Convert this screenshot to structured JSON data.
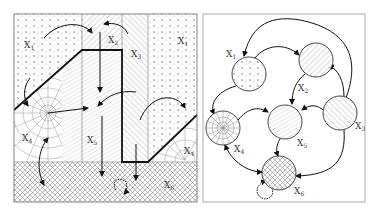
{
  "figure": {
    "left_panel": {
      "title": "state-space partition",
      "regions": [
        {
          "id": "X1",
          "label": "X",
          "sub": "1",
          "pattern": "dots"
        },
        {
          "id": "X1b",
          "label": "X",
          "sub": "1",
          "pattern": "dots"
        },
        {
          "id": "X2",
          "label": "X",
          "sub": "2",
          "pattern": "diagonal-right"
        },
        {
          "id": "X3",
          "label": "X",
          "sub": "3",
          "pattern": "diagonal-left"
        },
        {
          "id": "X4",
          "label": "X",
          "sub": "4",
          "pattern": "radial-web"
        },
        {
          "id": "X4b",
          "label": "X",
          "sub": "4",
          "pattern": "radial-web"
        },
        {
          "id": "X5",
          "label": "X",
          "sub": "5",
          "pattern": "diagonal-fine"
        },
        {
          "id": "X6",
          "label": "X",
          "sub": "6",
          "pattern": "crosshatch"
        }
      ]
    },
    "right_panel": {
      "title": "transition graph",
      "nodes": [
        {
          "id": "X1",
          "label": "X",
          "sub": "1",
          "pattern": "dots"
        },
        {
          "id": "X2",
          "label": "X",
          "sub": "2",
          "pattern": "diagonal-right"
        },
        {
          "id": "X3",
          "label": "X",
          "sub": "3",
          "pattern": "diagonal-left"
        },
        {
          "id": "X4",
          "label": "X",
          "sub": "4",
          "pattern": "radial-web"
        },
        {
          "id": "X5",
          "label": "X",
          "sub": "5",
          "pattern": "diagonal-fine"
        },
        {
          "id": "X6",
          "label": "X",
          "sub": "6",
          "pattern": "crosshatch"
        }
      ],
      "edges": [
        {
          "from": "X1",
          "to": "X2"
        },
        {
          "from": "X3",
          "to": "X1"
        },
        {
          "from": "X1",
          "to": "X4"
        },
        {
          "from": "X2",
          "to": "X5"
        },
        {
          "from": "X3",
          "to": "X2"
        },
        {
          "from": "X3",
          "to": "X5"
        },
        {
          "from": "X4",
          "to": "X5"
        },
        {
          "from": "X5",
          "to": "X6"
        },
        {
          "from": "X3",
          "to": "X6"
        },
        {
          "from": "X4",
          "to": "X6",
          "bidirectional": true
        },
        {
          "from": "X6",
          "to": "X6",
          "self_loop": true,
          "dotted": true
        }
      ]
    }
  }
}
